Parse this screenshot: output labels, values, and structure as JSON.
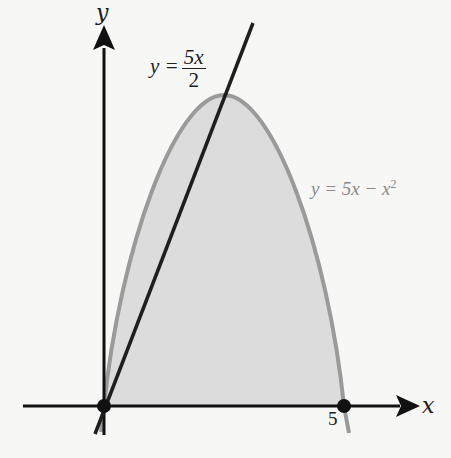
{
  "diagram": {
    "axes": {
      "x_label": "x",
      "y_label": "y",
      "tick_x_5": "5"
    },
    "curves": {
      "parabola": {
        "equation": "y = 5x − x²",
        "label_prefix": "y = 5x − x",
        "label_exp": "2",
        "color": "#9a9a9a"
      },
      "line": {
        "equation": "y = 5x/2",
        "label_lhs": "y =",
        "label_num": "5x",
        "label_den": "2",
        "color": "#1e1e1e"
      }
    },
    "region": {
      "description": "Shaded area under parabola y = 5x − x² from x = 0 to x = 5",
      "fill": "#dcdcdc"
    },
    "points": [
      {
        "x": 0,
        "y": 0,
        "label": ""
      },
      {
        "x": 5,
        "y": 0,
        "label": "5"
      }
    ]
  }
}
